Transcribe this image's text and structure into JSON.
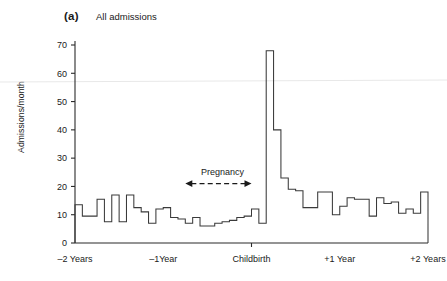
{
  "figure": {
    "panel_label": "(a)",
    "panel_title": "All admissions"
  },
  "chart_data": {
    "type": "line",
    "subtype": "step-histogram",
    "title": "All admissions",
    "panel": "(a)",
    "xlabel": "",
    "ylabel": "Admissions/month",
    "ylim": [
      0,
      70
    ],
    "yticks": [
      0,
      10,
      20,
      30,
      40,
      50,
      60,
      70
    ],
    "ytick_labels": [
      "0",
      "10",
      "20",
      "30",
      "40",
      "50",
      "60",
      "70"
    ],
    "xlim": [
      -24,
      24
    ],
    "xticks": [
      -24,
      -12,
      0,
      12,
      24
    ],
    "xtick_labels": [
      "–2 Years",
      "–1Year",
      "Childbirth",
      "+1 Year",
      "+2 Years"
    ],
    "x_unit": "months relative to childbirth",
    "grid": false,
    "legend": null,
    "annotations": [
      {
        "text": "Pregnancy",
        "type": "double-headed-dashed-arrow",
        "x_start": -9,
        "x_end": 0,
        "y": 21
      }
    ],
    "x": [
      -24,
      -23,
      -22,
      -21,
      -20,
      -19,
      -18,
      -17,
      -16,
      -15,
      -14,
      -13,
      -12,
      -11,
      -10,
      -9,
      -8,
      -7,
      -6,
      -5,
      -4,
      -3,
      -2,
      -1,
      0,
      1,
      2,
      3,
      4,
      5,
      6,
      7,
      8,
      9,
      10,
      11,
      12,
      13,
      14,
      15,
      16,
      17,
      18,
      19,
      20,
      21,
      22,
      23
    ],
    "values": [
      13.5,
      9.5,
      9.5,
      15.5,
      7.5,
      17,
      7.5,
      17,
      12.5,
      11,
      7,
      12,
      12.5,
      9,
      8.5,
      7,
      9,
      6,
      6,
      7,
      7.5,
      8,
      9,
      9.5,
      12,
      7,
      68,
      40,
      23,
      19,
      18.5,
      12.5,
      12.5,
      18,
      18,
      10,
      13,
      16,
      15.5,
      15.5,
      9.5,
      16,
      14,
      14.5,
      10.5,
      12,
      10.5,
      18
    ],
    "spike": {
      "x": 0,
      "value": 68,
      "label": "childbirth month peak"
    }
  }
}
